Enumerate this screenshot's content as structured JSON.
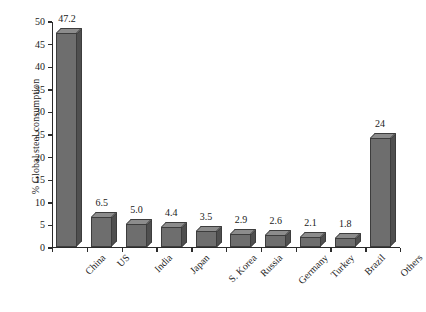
{
  "chart_data": {
    "type": "bar",
    "title": "",
    "xlabel": "",
    "ylabel": "% Global steel consumption",
    "ylim": [
      0,
      50
    ],
    "ytick_step": 5,
    "yticks": [
      "0",
      "5",
      "10",
      "15",
      "20",
      "25",
      "30",
      "35",
      "40",
      "45",
      "50"
    ],
    "grid": false,
    "legend": "none",
    "categories": [
      "China",
      "US",
      "India",
      "Japan",
      "S. Korea",
      "Russia",
      "Germany",
      "Turkey",
      "Brazil",
      "Others"
    ],
    "values": [
      47.2,
      6.5,
      5.0,
      4.4,
      3.5,
      2.9,
      2.6,
      2.1,
      1.8,
      24
    ],
    "value_labels": [
      "47.2",
      "6.5",
      "5.0",
      "4.4",
      "3.5",
      "2.9",
      "2.6",
      "2.1",
      "1.8",
      "24"
    ],
    "bar_style": "3d",
    "colors": {
      "bar_front": "#6e6e6e",
      "bar_top": "#8c8c8c",
      "bar_side": "#4f4f4f",
      "bar_edge": "#3d3d3d",
      "axis": "#2b2b2b",
      "text": "#1a1a1a",
      "background": "#ffffff"
    }
  }
}
